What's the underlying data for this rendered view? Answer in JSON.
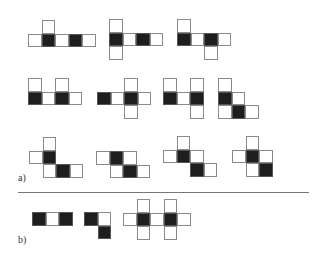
{
  "cell_size": 13.5,
  "colors": {
    "filled": "#1e1e1e",
    "empty": "#ffffff",
    "border": "#8a8a8a",
    "divider": "#777777"
  },
  "labels": {
    "a": "a)",
    "b": "b)"
  },
  "divider": {
    "x": 18,
    "y": 192,
    "width": 291
  },
  "groups": {
    "a": [
      {
        "id": "a-1",
        "x": 28,
        "y": 20,
        "cells": [
          [
            1,
            0,
            "w"
          ],
          [
            0,
            1,
            "w"
          ],
          [
            1,
            1,
            "b"
          ],
          [
            2,
            1,
            "w"
          ],
          [
            3,
            1,
            "b"
          ],
          [
            4,
            1,
            "w"
          ]
        ]
      },
      {
        "id": "a-2",
        "x": 109,
        "y": 19,
        "cells": [
          [
            0,
            0,
            "w"
          ],
          [
            0,
            1,
            "b"
          ],
          [
            1,
            1,
            "w"
          ],
          [
            2,
            1,
            "b"
          ],
          [
            3,
            1,
            "w"
          ],
          [
            0,
            2,
            "w"
          ]
        ]
      },
      {
        "id": "a-3",
        "x": 177,
        "y": 19,
        "cells": [
          [
            0,
            0,
            "w"
          ],
          [
            0,
            1,
            "b"
          ],
          [
            1,
            1,
            "w"
          ],
          [
            2,
            1,
            "b"
          ],
          [
            3,
            1,
            "w"
          ],
          [
            2,
            2,
            "w"
          ]
        ]
      },
      {
        "id": "a-4",
        "x": 28,
        "y": 78,
        "cells": [
          [
            0,
            0,
            "w"
          ],
          [
            2,
            0,
            "w"
          ],
          [
            0,
            1,
            "b"
          ],
          [
            1,
            1,
            "w"
          ],
          [
            2,
            1,
            "b"
          ],
          [
            3,
            1,
            "w"
          ]
        ]
      },
      {
        "id": "a-5",
        "x": 97,
        "y": 78,
        "cells": [
          [
            2,
            0,
            "w"
          ],
          [
            0,
            1,
            "b"
          ],
          [
            1,
            1,
            "w"
          ],
          [
            2,
            1,
            "b"
          ],
          [
            3,
            1,
            "w"
          ],
          [
            2,
            2,
            "w"
          ]
        ]
      },
      {
        "id": "a-6",
        "x": 163,
        "y": 78,
        "cells": [
          [
            0,
            0,
            "w"
          ],
          [
            2,
            0,
            "w"
          ],
          [
            0,
            1,
            "b"
          ],
          [
            1,
            1,
            "w"
          ],
          [
            2,
            1,
            "b"
          ],
          [
            2,
            2,
            "w"
          ]
        ]
      },
      {
        "id": "a-7",
        "x": 218,
        "y": 78,
        "cells": [
          [
            0,
            0,
            "w"
          ],
          [
            0,
            1,
            "b"
          ],
          [
            1,
            1,
            "w"
          ],
          [
            0,
            2,
            "w"
          ],
          [
            1,
            2,
            "b"
          ],
          [
            2,
            2,
            "w"
          ]
        ]
      },
      {
        "id": "a-8",
        "x": 29,
        "y": 137,
        "cells": [
          [
            1,
            0,
            "w"
          ],
          [
            0,
            1,
            "w"
          ],
          [
            1,
            1,
            "b"
          ],
          [
            1,
            2,
            "w"
          ],
          [
            2,
            2,
            "b"
          ],
          [
            3,
            2,
            "w"
          ]
        ]
      },
      {
        "id": "a-9",
        "x": 96,
        "y": 151,
        "cells": [
          [
            0,
            0,
            "w"
          ],
          [
            1,
            0,
            "b"
          ],
          [
            2,
            0,
            "w"
          ],
          [
            1,
            1,
            "w"
          ],
          [
            2,
            1,
            "b"
          ],
          [
            3,
            1,
            "w"
          ]
        ]
      },
      {
        "id": "a-10",
        "x": 163,
        "y": 136,
        "cells": [
          [
            1,
            0,
            "w"
          ],
          [
            0,
            1,
            "w"
          ],
          [
            1,
            1,
            "b"
          ],
          [
            2,
            1,
            "w"
          ],
          [
            2,
            2,
            "b"
          ],
          [
            3,
            2,
            "w"
          ]
        ]
      },
      {
        "id": "a-11",
        "x": 232,
        "y": 136,
        "cells": [
          [
            1,
            0,
            "w"
          ],
          [
            0,
            1,
            "w"
          ],
          [
            1,
            1,
            "b"
          ],
          [
            2,
            1,
            "w"
          ],
          [
            1,
            2,
            "w"
          ],
          [
            2,
            2,
            "b"
          ]
        ]
      }
    ],
    "b": [
      {
        "id": "b-1",
        "x": 32,
        "y": 212,
        "cells": [
          [
            0,
            0,
            "b"
          ],
          [
            1,
            0,
            "w"
          ],
          [
            2,
            0,
            "b"
          ]
        ]
      },
      {
        "id": "b-2",
        "x": 84,
        "y": 212,
        "cells": [
          [
            0,
            0,
            "b"
          ],
          [
            1,
            0,
            "w"
          ],
          [
            1,
            1,
            "b"
          ]
        ]
      },
      {
        "id": "b-3",
        "x": 123,
        "y": 199,
        "cells": [
          [
            1,
            0,
            "w"
          ],
          [
            3,
            0,
            "w"
          ],
          [
            0,
            1,
            "w"
          ],
          [
            1,
            1,
            "b"
          ],
          [
            2,
            1,
            "w"
          ],
          [
            3,
            1,
            "b"
          ],
          [
            4,
            1,
            "w"
          ],
          [
            1,
            2,
            "w"
          ],
          [
            3,
            2,
            "w"
          ]
        ]
      }
    ]
  }
}
